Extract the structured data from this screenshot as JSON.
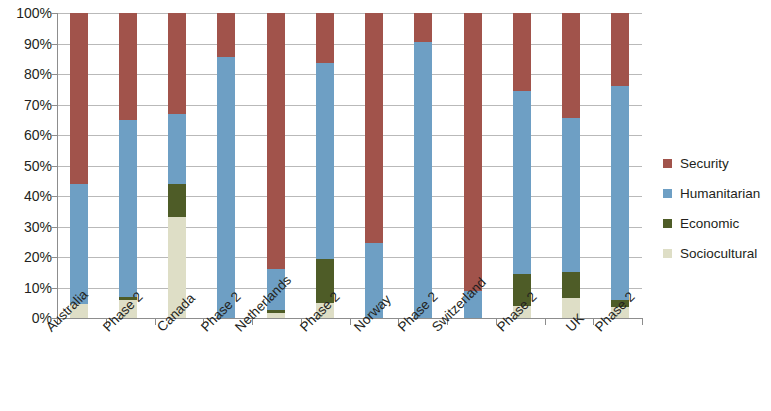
{
  "chart_data": {
    "type": "bar",
    "subtype": "stacked-column-100-percent",
    "title": "",
    "subtitle": "",
    "xlabel": "",
    "ylabel": "",
    "ylim": [
      0,
      100
    ],
    "yticks": [
      "0%",
      "10%",
      "20%",
      "30%",
      "40%",
      "50%",
      "60%",
      "70%",
      "80%",
      "90%",
      "100%"
    ],
    "ytick_values": [
      0,
      10,
      20,
      30,
      40,
      50,
      60,
      70,
      80,
      90,
      100
    ],
    "grid": true,
    "grid_axis": "y",
    "legend_position": "right",
    "legend": [
      "Security",
      "Humanitarian",
      "Economic",
      "Sociocultural"
    ],
    "stack_order_bottom_to_top": [
      "Sociocultural",
      "Economic",
      "Humanitarian",
      "Security"
    ],
    "colors": {
      "Security": "#a1534b",
      "Humanitarian": "#6e9fc4",
      "Economic": "#4e5c27",
      "Sociocultural": "#dedec6"
    },
    "groups": [
      "Australia",
      "Canada",
      "Netherlands",
      "Norway",
      "Switzerland",
      "UK"
    ],
    "categories": [
      "Australia",
      "Phase 2",
      "Canada",
      "Phase 2",
      "Netherlands",
      "Phase 2",
      "Norway",
      "Phase 2",
      "Switzerland",
      "Phase 2",
      "UK",
      "Phase 2"
    ],
    "series": [
      {
        "name": "Sociocultural",
        "color": "#dedec6",
        "values": [
          4.5,
          6.0,
          33.0,
          0.0,
          1.5,
          5.0,
          0.0,
          0.0,
          0.0,
          4.0,
          6.5,
          3.5
        ]
      },
      {
        "name": "Economic",
        "color": "#4e5c27",
        "values": [
          0.0,
          1.0,
          11.0,
          0.0,
          1.0,
          14.5,
          0.0,
          0.0,
          0.0,
          10.5,
          8.5,
          2.5
        ]
      },
      {
        "name": "Humanitarian",
        "color": "#6e9fc4",
        "values": [
          39.5,
          58.0,
          23.0,
          85.5,
          13.5,
          64.0,
          24.5,
          90.5,
          9.0,
          60.0,
          50.5,
          70.0
        ]
      },
      {
        "name": "Security",
        "color": "#a1534b",
        "values": [
          56.0,
          35.0,
          33.0,
          14.5,
          84.0,
          16.5,
          75.5,
          9.5,
          91.0,
          25.5,
          34.5,
          24.0
        ]
      }
    ],
    "cumulative_tops": [
      {
        "category": "Australia",
        "sociocultural": 4.5,
        "economic": 4.5,
        "humanitarian": 44.0,
        "security": 100
      },
      {
        "category": "Phase 2",
        "sociocultural": 6.0,
        "economic": 7.0,
        "humanitarian": 65.0,
        "security": 100
      },
      {
        "category": "Canada",
        "sociocultural": 33.0,
        "economic": 44.0,
        "humanitarian": 67.0,
        "security": 100
      },
      {
        "category": "Phase 2",
        "sociocultural": 0.0,
        "economic": 0.0,
        "humanitarian": 85.5,
        "security": 100
      },
      {
        "category": "Netherlands",
        "sociocultural": 1.5,
        "economic": 2.5,
        "humanitarian": 16.0,
        "security": 100
      },
      {
        "category": "Phase 2",
        "sociocultural": 5.0,
        "economic": 19.5,
        "humanitarian": 83.5,
        "security": 100
      },
      {
        "category": "Norway",
        "sociocultural": 0.0,
        "economic": 0.0,
        "humanitarian": 24.5,
        "security": 100
      },
      {
        "category": "Phase 2",
        "sociocultural": 0.0,
        "economic": 0.0,
        "humanitarian": 90.5,
        "security": 100
      },
      {
        "category": "Switzerland",
        "sociocultural": 0.0,
        "economic": 0.0,
        "humanitarian": 9.0,
        "security": 100
      },
      {
        "category": "Phase 2",
        "sociocultural": 4.0,
        "economic": 14.5,
        "humanitarian": 74.5,
        "security": 100
      },
      {
        "category": "UK",
        "sociocultural": 6.5,
        "economic": 15.0,
        "humanitarian": 65.5,
        "security": 100
      },
      {
        "category": "Phase 2",
        "sociocultural": 3.5,
        "economic": 6.0,
        "humanitarian": 76.0,
        "security": 100
      }
    ]
  }
}
